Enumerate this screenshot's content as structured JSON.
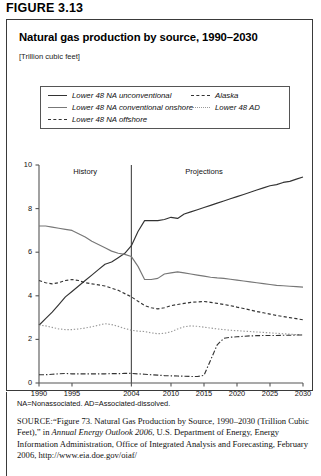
{
  "figure": {
    "label": "FIGURE 3.13"
  },
  "card": {
    "title": "Natural gas production by source, 1990–2030",
    "units": "[Trillion cubic feet]"
  },
  "legend": {
    "items": [
      {
        "label": "Lower 48 NA unconventional",
        "style": "solid",
        "color": "#333333"
      },
      {
        "label": "Lower 48 NA conventional onshore",
        "style": "solid",
        "color": "#777777"
      },
      {
        "label": "Lower 48 NA offshore",
        "style": "dashed",
        "color": "#333333"
      },
      {
        "label": "Alaska",
        "style": "dashdot",
        "color": "#333333"
      },
      {
        "label": "Lower 48 AD",
        "style": "dotted",
        "color": "#999999"
      }
    ]
  },
  "annotations": {
    "history": "History",
    "projections": "Projections",
    "divider_year": 2004
  },
  "notes": {
    "abbreviations": "NA=Nonassociated. AD=Associated-dissolved."
  },
  "source": {
    "label": "SOURCE:",
    "part1": "“Figure 73. Natural Gas Production by Source, 1990–2030 (Trillion Cubic Feet),” in ",
    "italic1": "Annual Energy Outlook 2006",
    "part2": ", U.S. Department of Energy, Energy Information Administration, Office of Integrated Analysis and Forecasting, February 2006, http://www.eia.doe.gov/oiaf/"
  },
  "chart_data": {
    "type": "line",
    "title": "Natural gas production by source, 1990–2030",
    "xlabel": "",
    "ylabel": "Trillion cubic feet",
    "xlim": [
      1990,
      2030
    ],
    "ylim": [
      0,
      10
    ],
    "yticks": [
      0,
      2,
      4,
      6,
      8,
      10
    ],
    "xticks": [
      1990,
      1995,
      2004,
      2010,
      2015,
      2020,
      2025,
      2030
    ],
    "grid": false,
    "legend_position": "top",
    "x": [
      1990,
      1991,
      1992,
      1993,
      1994,
      1995,
      1996,
      1997,
      1998,
      1999,
      2000,
      2001,
      2002,
      2003,
      2004,
      2005,
      2006,
      2007,
      2008,
      2009,
      2010,
      2011,
      2012,
      2013,
      2014,
      2015,
      2016,
      2017,
      2018,
      2019,
      2020,
      2021,
      2022,
      2023,
      2024,
      2025,
      2026,
      2027,
      2028,
      2029,
      2030
    ],
    "series": [
      {
        "name": "Lower 48 NA unconventional",
        "style": "solid",
        "color": "#333333",
        "values": [
          2.65,
          2.95,
          3.25,
          3.6,
          3.95,
          4.2,
          4.45,
          4.7,
          4.95,
          5.2,
          5.45,
          5.55,
          5.75,
          5.95,
          6.3,
          6.95,
          7.45,
          7.45,
          7.45,
          7.5,
          7.6,
          7.55,
          7.75,
          7.85,
          7.95,
          8.05,
          8.15,
          8.25,
          8.35,
          8.45,
          8.55,
          8.65,
          8.75,
          8.85,
          8.95,
          9.05,
          9.1,
          9.2,
          9.25,
          9.35,
          9.45
        ]
      },
      {
        "name": "Lower 48 NA conventional onshore",
        "style": "solid",
        "color": "#777777",
        "values": [
          7.2,
          7.2,
          7.15,
          7.1,
          7.05,
          7.0,
          6.85,
          6.7,
          6.5,
          6.35,
          6.2,
          6.05,
          5.95,
          5.9,
          5.8,
          5.35,
          4.75,
          4.75,
          4.8,
          5.0,
          5.05,
          5.1,
          5.05,
          5.0,
          4.95,
          4.9,
          4.85,
          4.82,
          4.8,
          4.76,
          4.72,
          4.68,
          4.64,
          4.6,
          4.56,
          4.52,
          4.48,
          4.46,
          4.44,
          4.42,
          4.4
        ]
      },
      {
        "name": "Lower 48 NA offshore",
        "style": "dashed",
        "color": "#333333",
        "values": [
          4.7,
          4.6,
          4.55,
          4.6,
          4.7,
          4.75,
          4.7,
          4.6,
          4.55,
          4.5,
          4.45,
          4.35,
          4.25,
          4.1,
          3.95,
          3.75,
          3.55,
          3.45,
          3.4,
          3.45,
          3.55,
          3.6,
          3.65,
          3.7,
          3.72,
          3.74,
          3.7,
          3.65,
          3.6,
          3.55,
          3.48,
          3.42,
          3.35,
          3.28,
          3.22,
          3.16,
          3.1,
          3.05,
          3.0,
          2.95,
          2.9
        ]
      },
      {
        "name": "Lower 48 AD",
        "style": "dotted",
        "color": "#999999",
        "values": [
          2.65,
          2.62,
          2.55,
          2.48,
          2.45,
          2.45,
          2.48,
          2.52,
          2.58,
          2.65,
          2.72,
          2.68,
          2.6,
          2.5,
          2.42,
          2.38,
          2.36,
          2.3,
          2.26,
          2.28,
          2.35,
          2.48,
          2.58,
          2.62,
          2.6,
          2.56,
          2.52,
          2.48,
          2.45,
          2.42,
          2.4,
          2.38,
          2.36,
          2.34,
          2.32,
          2.3,
          2.28,
          2.26,
          2.24,
          2.22,
          2.2
        ]
      },
      {
        "name": "Alaska",
        "style": "dashdot",
        "color": "#333333",
        "values": [
          0.38,
          0.38,
          0.4,
          0.42,
          0.44,
          0.42,
          0.42,
          0.42,
          0.42,
          0.42,
          0.42,
          0.43,
          0.43,
          0.44,
          0.44,
          0.42,
          0.4,
          0.38,
          0.36,
          0.34,
          0.33,
          0.32,
          0.31,
          0.3,
          0.3,
          0.35,
          1.05,
          1.75,
          2.05,
          2.1,
          2.12,
          2.14,
          2.16,
          2.17,
          2.18,
          2.18,
          2.18,
          2.19,
          2.19,
          2.2,
          2.2
        ]
      }
    ]
  }
}
